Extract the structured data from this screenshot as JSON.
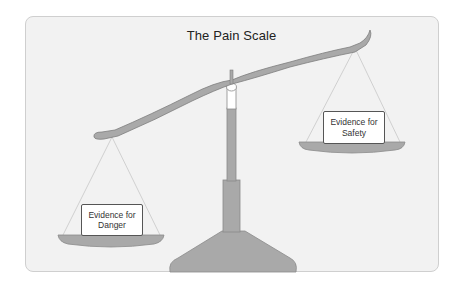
{
  "diagram": {
    "title": "The Pain Scale",
    "right_pan": {
      "line1": "Evidence for",
      "line2": "Safety"
    },
    "left_pan": {
      "line1": "Evidence for",
      "line2": "Danger"
    }
  },
  "colors": {
    "panel_bg": "#f2f2f2",
    "scale_fill": "#a9a9a9",
    "scale_stroke": "#7d7d7d",
    "rope": "#b5b5b5"
  }
}
